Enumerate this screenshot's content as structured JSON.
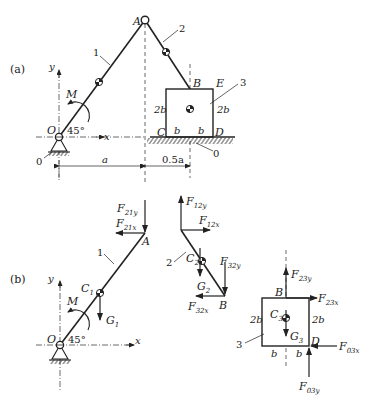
{
  "figure": {
    "part_a": {
      "label": "(a)",
      "points": {
        "O": "O",
        "A": "A",
        "B": "B",
        "C": "C",
        "D": "D",
        "E": "E"
      },
      "links": {
        "link1": "1",
        "link2": "2",
        "link3": "3",
        "ground": "0",
        "ground2": "0"
      },
      "axes": {
        "x": "x",
        "y": "y"
      },
      "moment": "M",
      "angle": "45°",
      "dims": {
        "side_left": "2b",
        "side_right": "2b",
        "half_left": "b",
        "half_right": "b",
        "a": "a",
        "half_a": "0.5a"
      }
    },
    "part_b": {
      "label": "(b)",
      "link1": {
        "label": "1",
        "points": {
          "O": "O",
          "A": "A",
          "C1": "C",
          "C1_sub": "1"
        },
        "forces": {
          "F21y": {
            "main": "F",
            "sub": "21y"
          },
          "F21x": {
            "main": "F",
            "sub": "21x"
          },
          "G1": {
            "main": "G",
            "sub": "1"
          }
        },
        "moment": "M",
        "angle": "45°",
        "axes": {
          "x": "x",
          "y": "y"
        }
      },
      "link2": {
        "label": "2",
        "points": {
          "B": "B",
          "C2": "C",
          "C2_sub": "2"
        },
        "forces": {
          "F12y": {
            "main": "F",
            "sub": "12y"
          },
          "F12x": {
            "main": "F",
            "sub": "12x"
          },
          "F32y": {
            "main": "F",
            "sub": "32y"
          },
          "F32x": {
            "main": "F",
            "sub": "32x"
          },
          "G2": {
            "main": "G",
            "sub": "2"
          }
        }
      },
      "link3": {
        "label": "3",
        "points": {
          "B": "B",
          "D": "D",
          "C3": "C",
          "C3_sub": "3"
        },
        "dims": {
          "side_left": "2b",
          "side_right": "2b",
          "half_left": "b",
          "half_right": "b"
        },
        "forces": {
          "F23y": {
            "main": "F",
            "sub": "23y"
          },
          "F23x": {
            "main": "F",
            "sub": "23x"
          },
          "F03x": {
            "main": "F",
            "sub": "03x"
          },
          "F03y": {
            "main": "F",
            "sub": "03y"
          },
          "G3": {
            "main": "G",
            "sub": "3"
          }
        }
      }
    }
  }
}
